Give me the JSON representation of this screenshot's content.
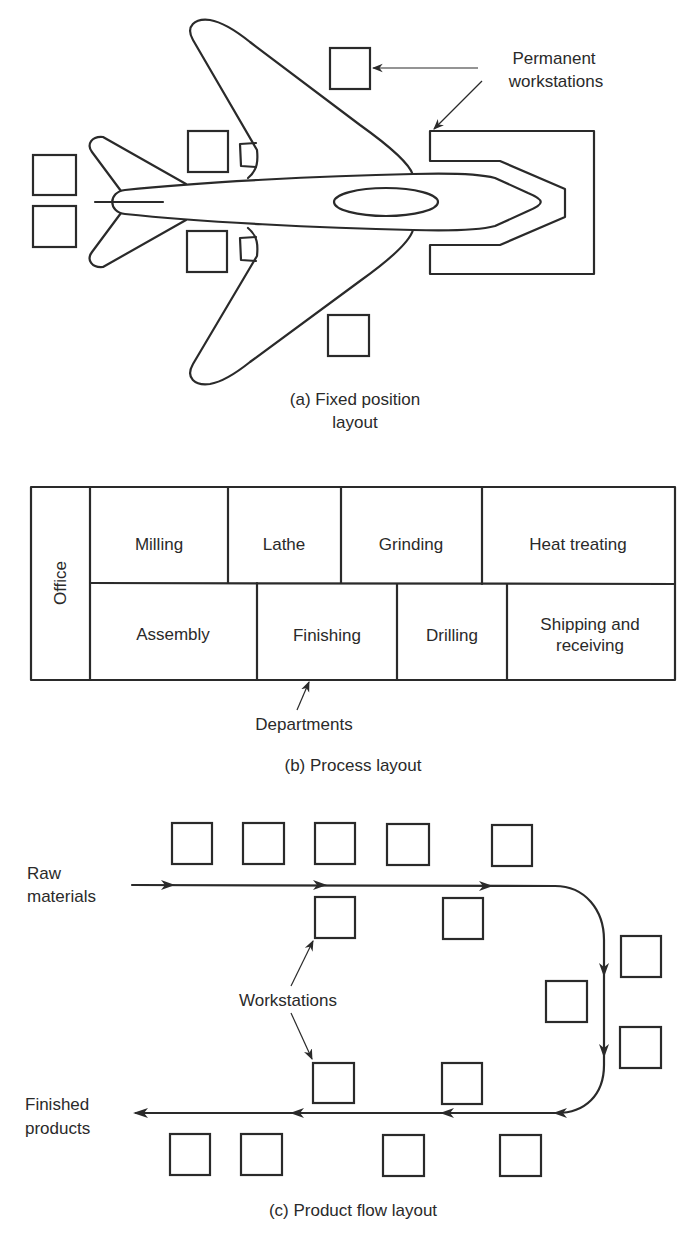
{
  "figure": {
    "panel_a": {
      "caption_line1": "(a) Fixed position",
      "caption_line2": "layout",
      "annotation_line1": "Permanent",
      "annotation_line2": "workstations",
      "workstation_count": 7
    },
    "panel_b": {
      "caption": "(b) Process layout",
      "annotation": "Departments",
      "office_label": "Office",
      "top_row": [
        "Milling",
        "Lathe",
        "Grinding",
        "Heat treating"
      ],
      "bottom_row": [
        "Assembly",
        "Finishing",
        "Drilling",
        "Shipping and receiving"
      ],
      "bottom_row_last_line1": "Shipping and",
      "bottom_row_last_line2": "receiving"
    },
    "panel_c": {
      "caption": "(c) Product flow layout",
      "input_label_line1": "Raw",
      "input_label_line2": "materials",
      "output_label_line1": "Finished",
      "output_label_line2": "products",
      "annotation": "Workstations",
      "workstation_count": 16
    }
  },
  "colors": {
    "ink": "#2a2a2a",
    "background": "#ffffff"
  }
}
